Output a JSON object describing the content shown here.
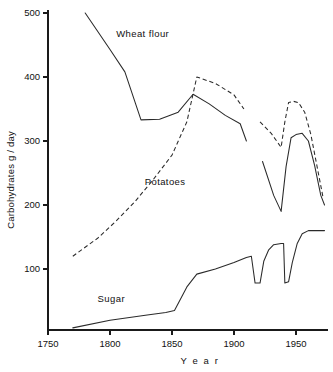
{
  "chart_data": {
    "type": "line",
    "title": "",
    "xlabel": "Y e a r",
    "ylabel": "Carbohydrates  g / day",
    "xlim": [
      1750,
      1975
    ],
    "ylim": [
      0,
      500
    ],
    "grid": false,
    "legend_position": "inline-annotations",
    "xticks": [
      1750,
      1800,
      1850,
      1900,
      1950
    ],
    "xtick_labels": [
      "1750",
      "1800",
      "1850",
      "1900",
      "1950"
    ],
    "yticks": [
      100,
      200,
      300,
      400,
      500
    ],
    "ytick_labels": [
      "100",
      "200",
      "300",
      "400",
      "500"
    ],
    "series": [
      {
        "name": "Wheat flour",
        "style": "solid",
        "color": "#2a2a2a",
        "label_x": 1805,
        "label_y": 462,
        "segments": [
          {
            "x": [
              1780,
              1800,
              1812,
              1825,
              1840,
              1855,
              1867,
              1880,
              1893,
              1905,
              1910
            ],
            "y": [
              500,
              443,
              408,
              333,
              334,
              345,
              373,
              358,
              340,
              327,
              300
            ]
          },
          {
            "x": [
              1923,
              1932,
              1938,
              1942,
              1946,
              1950,
              1955,
              1960,
              1965,
              1970,
              1973
            ],
            "y": [
              268,
              215,
              190,
              260,
              305,
              310,
              312,
              300,
              262,
              215,
              200
            ]
          }
        ]
      },
      {
        "name": "Potatoes",
        "style": "dashed",
        "color": "#2a2a2a",
        "label_x": 1828,
        "label_y": 232,
        "segments": [
          {
            "x": [
              1770,
              1790,
              1805,
              1820,
              1835,
              1850,
              1862,
              1870,
              1885,
              1900,
              1908
            ],
            "y": [
              120,
              148,
              175,
              205,
              240,
              278,
              330,
              400,
              390,
              372,
              350
            ]
          },
          {
            "x": [
              1921,
              1930,
              1938,
              1941,
              1944,
              1948,
              1952,
              1957,
              1962,
              1968,
              1972
            ],
            "y": [
              330,
              312,
              290,
              330,
              360,
              362,
              360,
              345,
              310,
              250,
              210
            ]
          }
        ]
      },
      {
        "name": "Sugar",
        "style": "solid",
        "color": "#2a2a2a",
        "label_x": 1790,
        "label_y": 48,
        "segments": [
          {
            "x": [
              1770,
              1800,
              1830,
              1845,
              1852,
              1862,
              1870,
              1885,
              1900,
              1910,
              1914,
              1917,
              1918,
              1921,
              1924,
              1928,
              1932,
              1938,
              1940,
              1941,
              1944,
              1947,
              1951,
              1955,
              1960,
              1965,
              1973
            ],
            "y": [
              8,
              20,
              28,
              32,
              35,
              72,
              92,
              100,
              110,
              118,
              120,
              78,
              78,
              78,
              112,
              130,
              138,
              140,
              140,
              78,
              80,
              110,
              140,
              155,
              160,
              160,
              160
            ]
          }
        ]
      }
    ]
  }
}
